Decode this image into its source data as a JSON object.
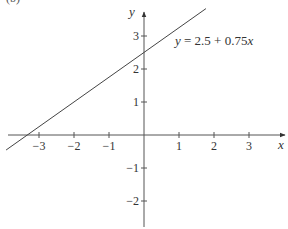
{
  "panel_label": "(b)",
  "chart_data": {
    "type": "line",
    "title": "",
    "xlabel": "x",
    "ylabel": "y",
    "xlim": [
      -4,
      4
    ],
    "ylim": [
      -2.8,
      3.7
    ],
    "grid": false,
    "legend": null,
    "x_ticks": [
      -3,
      -2,
      -1,
      1,
      2,
      3
    ],
    "y_ticks": [
      -2,
      -1,
      1,
      2,
      3
    ],
    "x_tick_labels": [
      "−3",
      "−2",
      "−1",
      "1",
      "2",
      "3"
    ],
    "y_tick_labels": [
      "−2",
      "−1",
      "1",
      "2",
      "3"
    ],
    "series": [
      {
        "name": "y = 2.5 + 0.75x",
        "equation": {
          "intercept": 2.5,
          "slope": 0.75
        },
        "x": [
          -3.94,
          1.77
        ],
        "y": [
          -0.455,
          3.83
        ]
      }
    ],
    "annotations": [
      {
        "text": "y = 2.5 + 0.75x",
        "x": 0.9,
        "y": 2.75
      }
    ]
  }
}
